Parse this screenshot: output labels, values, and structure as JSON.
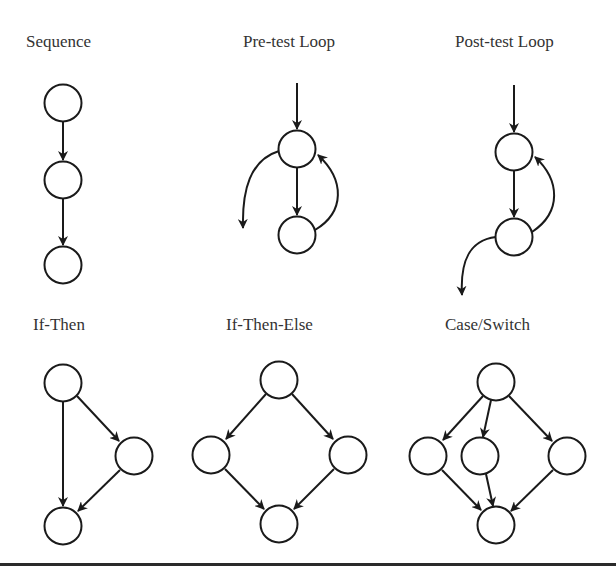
{
  "diagrams": [
    {
      "id": "sequence",
      "title": "Sequence",
      "nodes": [
        "n1",
        "n2",
        "n3"
      ],
      "edges": [
        [
          "n1",
          "n2"
        ],
        [
          "n2",
          "n3"
        ]
      ]
    },
    {
      "id": "pretest",
      "title": "Pre-test Loop",
      "nodes": [
        "test",
        "body"
      ],
      "edges": [
        [
          "entry",
          "test"
        ],
        [
          "test",
          "body"
        ],
        [
          "body",
          "test"
        ],
        [
          "test",
          "exit"
        ]
      ]
    },
    {
      "id": "posttest",
      "title": "Post-test Loop",
      "nodes": [
        "body",
        "test"
      ],
      "edges": [
        [
          "entry",
          "body"
        ],
        [
          "body",
          "test"
        ],
        [
          "test",
          "body"
        ],
        [
          "test",
          "exit"
        ]
      ]
    },
    {
      "id": "ifthen",
      "title": "If-Then",
      "nodes": [
        "cond",
        "then",
        "join"
      ],
      "edges": [
        [
          "cond",
          "then"
        ],
        [
          "cond",
          "join"
        ],
        [
          "then",
          "join"
        ]
      ]
    },
    {
      "id": "ifthenelse",
      "title": "If-Then-Else",
      "nodes": [
        "cond",
        "then",
        "else",
        "join"
      ],
      "edges": [
        [
          "cond",
          "then"
        ],
        [
          "cond",
          "else"
        ],
        [
          "then",
          "join"
        ],
        [
          "else",
          "join"
        ]
      ]
    },
    {
      "id": "caseswitch",
      "title": "Case/Switch",
      "nodes": [
        "switch",
        "case1",
        "case2",
        "case3",
        "join"
      ],
      "edges": [
        [
          "switch",
          "case1"
        ],
        [
          "switch",
          "case2"
        ],
        [
          "switch",
          "case3"
        ],
        [
          "case1",
          "join"
        ],
        [
          "case2",
          "join"
        ],
        [
          "case3",
          "join"
        ]
      ]
    }
  ]
}
